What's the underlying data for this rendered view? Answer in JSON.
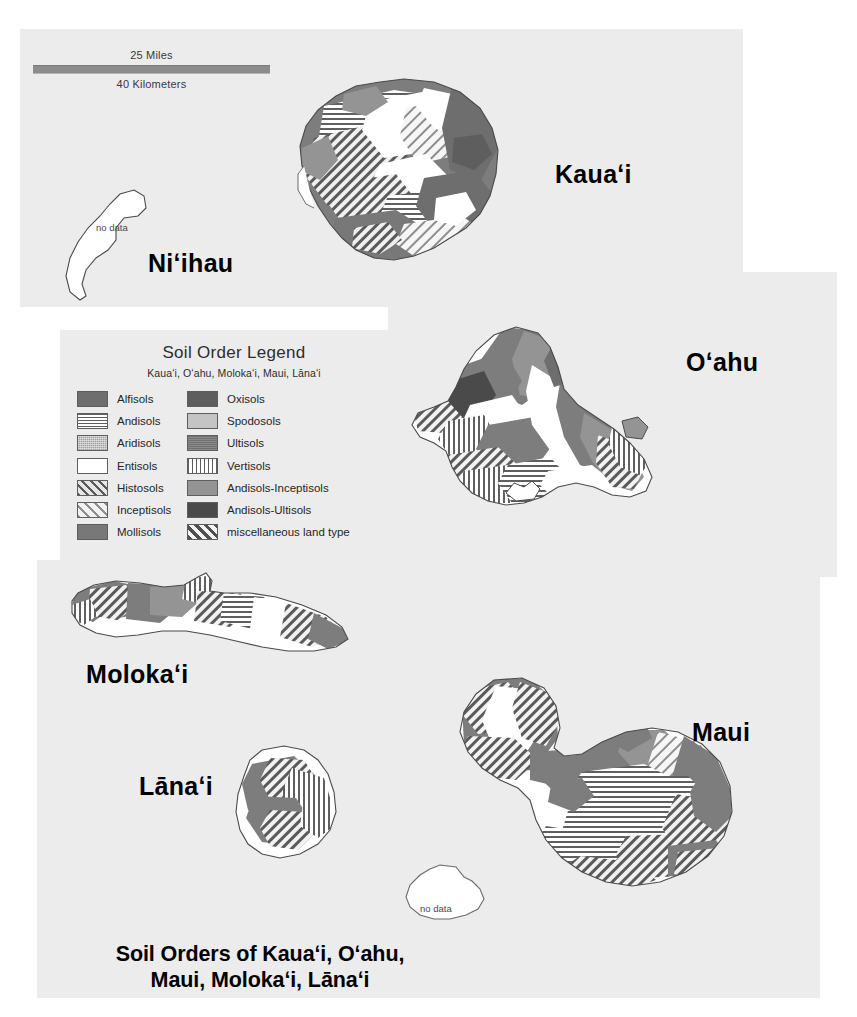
{
  "map": {
    "title_line1": "Soil Orders of Kauaʻi, Oʻahu,",
    "title_line2": "Maui, Molokaʻi, Lānaʻi",
    "background": "#ffffff",
    "panel_color": "#ececec"
  },
  "scalebar": {
    "miles_label": "25 Miles",
    "kilometers_label": "40 Kilometers",
    "bar_color": "#8c8c8c"
  },
  "islands": [
    {
      "name": "Kauaʻi",
      "label": "Kauaʻi",
      "has_data": true
    },
    {
      "name": "Niʻihau",
      "label": "Niʻihau",
      "has_data": false,
      "nodata_text": "no data"
    },
    {
      "name": "Oʻahu",
      "label": "Oʻahu",
      "has_data": true
    },
    {
      "name": "Molokaʻi",
      "label": "Molokaʻi",
      "has_data": true
    },
    {
      "name": "Lānaʻi",
      "label": "Lānaʻi",
      "has_data": true
    },
    {
      "name": "Maui",
      "label": "Maui",
      "has_data": true
    },
    {
      "name": "Kahoʻolawe",
      "label": "",
      "has_data": false,
      "nodata_text": "no data"
    }
  ],
  "legend": {
    "title": "Soil Order Legend",
    "subtitle": "Kauaʻi, Oʻahu, Molokaʻi, Maui, Lānaʻi",
    "left_column": [
      {
        "label": "Alfisols",
        "pattern": "solid-dark-gray",
        "color": "#6e6e6e"
      },
      {
        "label": "Andisols",
        "pattern": "horizontal-lines",
        "color": "#5f5f5f"
      },
      {
        "label": "Aridisols",
        "pattern": "fine-dotted",
        "color": "#a2a2a2"
      },
      {
        "label": "Entisols",
        "pattern": "white",
        "color": "#ffffff"
      },
      {
        "label": "Histosols",
        "pattern": "diagonal-dark",
        "color": "#5a5a5a"
      },
      {
        "label": "Inceptisols",
        "pattern": "diagonal-light",
        "color": "#8e8e8e"
      },
      {
        "label": "Mollisols",
        "pattern": "solid-gray",
        "color": "#787878"
      }
    ],
    "right_column": [
      {
        "label": "Oxisols",
        "pattern": "solid-darker-gray",
        "color": "#5e5e5e"
      },
      {
        "label": "Spodosols",
        "pattern": "solid-light-gray",
        "color": "#c4c4c4"
      },
      {
        "label": "Ultisols",
        "pattern": "solid-mid-gray",
        "color": "#8a8a8a"
      },
      {
        "label": "Vertisols",
        "pattern": "vertical-lines",
        "color": "#5f5f5f"
      },
      {
        "label": "Andisols-Inceptisols",
        "pattern": "solid-medium-gray",
        "color": "#949494"
      },
      {
        "label": "Andisols-Ultisols",
        "pattern": "solid-very-dark",
        "color": "#4a4a4a"
      },
      {
        "label": "miscellaneous land type",
        "pattern": "diagonal-bold",
        "color": "#4f4f4f"
      }
    ]
  }
}
